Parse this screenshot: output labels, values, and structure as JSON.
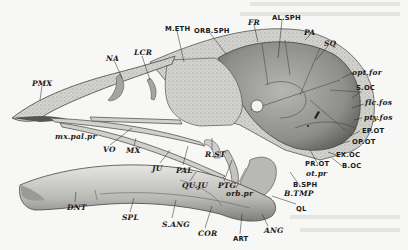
{
  "figure": {
    "colors": {
      "paper": "#f7f7f5",
      "bone_light": "#d8d8d6",
      "bone_mid": "#a9a9a7",
      "bone_dark": "#6e6e6c",
      "stipple": "#c9c9c6",
      "ink": "#1a1a1a"
    },
    "labels": [
      {
        "id": "pmx",
        "text": "PMX",
        "style": "italic",
        "x": 32,
        "y": 80
      },
      {
        "id": "na",
        "text": "NA",
        "style": "italic",
        "x": 106,
        "y": 55
      },
      {
        "id": "lcr",
        "text": "LCR",
        "style": "italic",
        "x": 134,
        "y": 49
      },
      {
        "id": "meth",
        "text": "M.ETH",
        "style": "roman",
        "x": 165,
        "y": 25
      },
      {
        "id": "orbsph",
        "text": "ORB.SPH",
        "style": "roman",
        "x": 194,
        "y": 27
      },
      {
        "id": "fr",
        "text": "FR",
        "style": "italic",
        "x": 248,
        "y": 19
      },
      {
        "id": "alsph",
        "text": "AL.SPH",
        "style": "roman",
        "x": 272,
        "y": 14
      },
      {
        "id": "pa",
        "text": "PA",
        "style": "italic",
        "x": 304,
        "y": 29
      },
      {
        "id": "sq",
        "text": "SQ",
        "style": "italic",
        "x": 324,
        "y": 40
      },
      {
        "id": "optfor",
        "text": "opt.for",
        "style": "italic",
        "x": 352,
        "y": 69
      },
      {
        "id": "soc",
        "text": "S.OC",
        "style": "roman",
        "x": 356,
        "y": 84
      },
      {
        "id": "flcfos",
        "text": "flc.fos",
        "style": "italic",
        "x": 365,
        "y": 99
      },
      {
        "id": "ptyfos",
        "text": "pty.fos",
        "style": "italic",
        "x": 364,
        "y": 114
      },
      {
        "id": "epot",
        "text": "EP.OT",
        "style": "roman",
        "x": 362,
        "y": 127
      },
      {
        "id": "opot",
        "text": "OP.OT",
        "style": "roman",
        "x": 352,
        "y": 138
      },
      {
        "id": "exoc",
        "text": "EX.OC",
        "style": "roman",
        "x": 336,
        "y": 151
      },
      {
        "id": "boc",
        "text": "B.OC",
        "style": "roman",
        "x": 342,
        "y": 162
      },
      {
        "id": "prot",
        "text": "PR.OT",
        "style": "roman",
        "x": 305,
        "y": 160
      },
      {
        "id": "otpr",
        "text": "ot.pr",
        "style": "italic",
        "x": 306,
        "y": 170
      },
      {
        "id": "bsph",
        "text": "B.SPH",
        "style": "roman",
        "x": 293,
        "y": 183
      },
      {
        "id": "btmp",
        "text": "B.TMP",
        "style": "italic",
        "x": 284,
        "y": 190
      },
      {
        "id": "ql",
        "text": "QL",
        "style": "roman",
        "x": 296,
        "y": 205
      },
      {
        "id": "ang",
        "text": "ANG",
        "style": "italic",
        "x": 264,
        "y": 227
      },
      {
        "id": "art",
        "text": "ART",
        "style": "roman",
        "x": 233,
        "y": 235
      },
      {
        "id": "cor",
        "text": "COR",
        "style": "italic",
        "x": 198,
        "y": 230
      },
      {
        "id": "sang",
        "text": "S.ANG",
        "style": "italic",
        "x": 162,
        "y": 221
      },
      {
        "id": "spl",
        "text": "SPL",
        "style": "italic",
        "x": 122,
        "y": 214
      },
      {
        "id": "dnt",
        "text": "DNT",
        "style": "italic",
        "x": 67,
        "y": 204
      },
      {
        "id": "quju",
        "text": "QU.JU",
        "style": "italic",
        "x": 182,
        "y": 182
      },
      {
        "id": "ptg",
        "text": "PTG",
        "style": "italic",
        "x": 218,
        "y": 182
      },
      {
        "id": "orbpr",
        "text": "orb.pr",
        "style": "italic",
        "x": 226,
        "y": 190
      },
      {
        "id": "pal",
        "text": "PAL",
        "style": "italic",
        "x": 176,
        "y": 167
      },
      {
        "id": "ju",
        "text": "JU",
        "style": "italic",
        "x": 152,
        "y": 165
      },
      {
        "id": "rst",
        "text": "R.ST",
        "style": "italic",
        "x": 205,
        "y": 151
      },
      {
        "id": "vo",
        "text": "VO",
        "style": "italic",
        "x": 103,
        "y": 146
      },
      {
        "id": "mx",
        "text": "MX",
        "style": "italic",
        "x": 126,
        "y": 147
      },
      {
        "id": "maxpalpr",
        "text": "mx.pal.pr",
        "style": "italic",
        "x": 55,
        "y": 133
      }
    ]
  }
}
